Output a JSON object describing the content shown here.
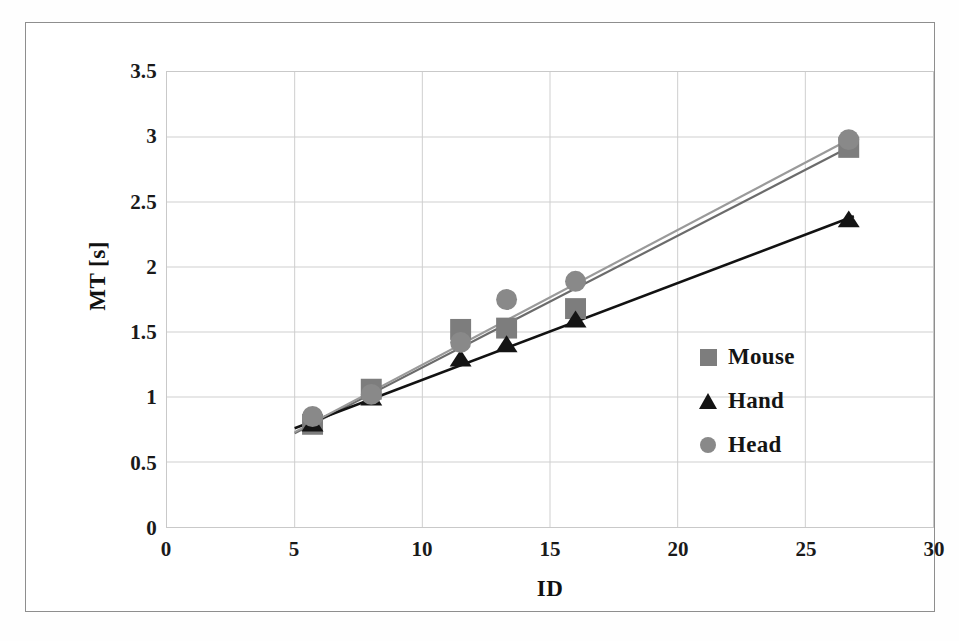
{
  "chart_data": {
    "type": "scatter",
    "title": "",
    "xlabel": "ID",
    "ylabel": "MT [s]",
    "xlim": [
      0,
      30
    ],
    "ylim": [
      0,
      3.5
    ],
    "xticks": [
      "0",
      "5",
      "10",
      "15",
      "20",
      "25",
      "30"
    ],
    "xtick_values": [
      0,
      5,
      10,
      15,
      20,
      25,
      30
    ],
    "yticks": [
      "0",
      "0.5",
      "1",
      "1.5",
      "2",
      "2.5",
      "3",
      "3.5"
    ],
    "ytick_values": [
      0,
      0.5,
      1,
      1.5,
      2,
      2.5,
      3,
      3.5
    ],
    "grid": true,
    "legend_position": "inside-right",
    "series": [
      {
        "name": "Mouse",
        "marker": "square",
        "color": "#7d7d7d",
        "line_color": "#6b6b6b",
        "points": [
          {
            "x": 5.7,
            "y": 0.79
          },
          {
            "x": 8.0,
            "y": 1.06
          },
          {
            "x": 11.5,
            "y": 1.52
          },
          {
            "x": 13.3,
            "y": 1.53
          },
          {
            "x": 16.0,
            "y": 1.68
          },
          {
            "x": 26.7,
            "y": 2.92
          }
        ],
        "fit_line": {
          "x0": 5.0,
          "y0": 0.72,
          "x1": 26.9,
          "y1": 2.94
        }
      },
      {
        "name": "Hand",
        "marker": "triangle",
        "color": "#141414",
        "line_color": "#121212",
        "points": [
          {
            "x": 5.7,
            "y": 0.8
          },
          {
            "x": 8.0,
            "y": 1.0
          },
          {
            "x": 11.5,
            "y": 1.3
          },
          {
            "x": 13.3,
            "y": 1.41
          },
          {
            "x": 16.0,
            "y": 1.6
          },
          {
            "x": 26.7,
            "y": 2.37
          }
        ],
        "fit_line": {
          "x0": 5.0,
          "y0": 0.76,
          "x1": 26.9,
          "y1": 2.39
        }
      },
      {
        "name": "Head",
        "marker": "circle",
        "color": "#898989",
        "line_color": "#9a9a9a",
        "points": [
          {
            "x": 5.7,
            "y": 0.85
          },
          {
            "x": 8.0,
            "y": 1.02
          },
          {
            "x": 11.5,
            "y": 1.42
          },
          {
            "x": 13.3,
            "y": 1.75
          },
          {
            "x": 16.0,
            "y": 1.89
          },
          {
            "x": 26.7,
            "y": 2.98
          }
        ],
        "fit_line": {
          "x0": 5.0,
          "y0": 0.73,
          "x1": 26.9,
          "y1": 3.0
        }
      }
    ]
  },
  "axes": {
    "y_title": "MT [s]",
    "x_title": "ID"
  },
  "legend": {
    "items": [
      {
        "label": "Mouse",
        "marker": "square",
        "color": "#7d7d7d"
      },
      {
        "label": "Hand",
        "marker": "triangle",
        "color": "#141414"
      },
      {
        "label": "Head",
        "marker": "circle",
        "color": "#898989"
      }
    ]
  },
  "style": {
    "grid_color": "#cfcfcf",
    "plot_border_color": "#c9c9c9",
    "frame_color": "#8e8e8e",
    "text_color": "#141414",
    "background": "#ffffff"
  }
}
